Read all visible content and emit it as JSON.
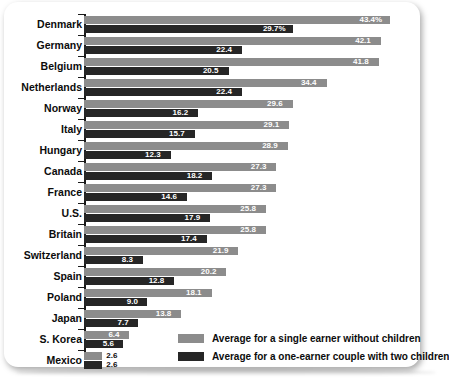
{
  "chart_data": {
    "type": "bar",
    "orientation": "horizontal",
    "title": "",
    "subtitle": "",
    "xlabel": "",
    "ylabel": "",
    "xlim": [
      0,
      43.4
    ],
    "grid": false,
    "legend_position": "bottom-right",
    "categories": [
      "Denmark",
      "Germany",
      "Belgium",
      "Netherlands",
      "Norway",
      "Italy",
      "Hungary",
      "Canada",
      "France",
      "U.S.",
      "Britain",
      "Switzerland",
      "Spain",
      "Poland",
      "Japan",
      "S. Korea",
      "Mexico"
    ],
    "series": [
      {
        "name": "Average for a single earner without children",
        "color": "#8c8c8c",
        "values": [
          43.4,
          42.1,
          41.8,
          34.4,
          29.6,
          29.1,
          28.9,
          27.3,
          27.3,
          25.8,
          25.8,
          21.9,
          20.2,
          18.1,
          13.8,
          6.4,
          2.6
        ],
        "labels": [
          "43.4%",
          "42.1",
          "41.8",
          "34.4",
          "29.6",
          "29.1",
          "28.9",
          "27.3",
          "27.3",
          "25.8",
          "25.8",
          "21.9",
          "20.2",
          "18.1",
          "13.8",
          "6.4",
          "2.6"
        ]
      },
      {
        "name": "Average for a one-earner couple with two children",
        "color": "#262626",
        "values": [
          29.7,
          22.4,
          20.5,
          22.4,
          16.2,
          15.7,
          12.3,
          18.2,
          14.6,
          17.9,
          17.4,
          8.3,
          12.8,
          9.0,
          7.7,
          5.6,
          2.6
        ],
        "labels": [
          "29.7%",
          "22.4",
          "20.5",
          "22.4",
          "16.2",
          "15.7",
          "12.3",
          "18.2",
          "14.6",
          "17.9",
          "17.4",
          "8.3",
          "12.8",
          "9.0",
          "7.7",
          "5.6",
          "2.6"
        ]
      }
    ]
  },
  "legend": {
    "items": [
      {
        "label": "Average for a single earner without children",
        "swatch": "light"
      },
      {
        "label": "Average for a one-earner couple with two children",
        "swatch": "dark"
      }
    ]
  },
  "colors": {
    "light_bar": "#8c8c8c",
    "dark_bar": "#262626",
    "text": "#0c0c0c",
    "card": "#ffffff"
  }
}
